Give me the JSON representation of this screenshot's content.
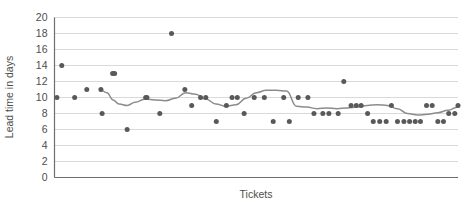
{
  "chart_data": {
    "type": "scatter",
    "title": "",
    "subtitle": "",
    "xlabel": "Tickets",
    "ylabel": "Lead time in days",
    "xlim": [
      0,
      100
    ],
    "ylim": [
      0,
      20
    ],
    "yticks": [
      0,
      2,
      4,
      6,
      8,
      10,
      12,
      14,
      16,
      18,
      20
    ],
    "ytick_labels": [
      "0",
      "2",
      "4",
      "6",
      "8",
      "10",
      "12",
      "14",
      "16",
      "18",
      "20"
    ],
    "xticks": [],
    "xtick_labels": [],
    "grid": "horizontal",
    "legend": "none",
    "annotations": [],
    "colors": {
      "marker": "#59595b",
      "trend_line": "#8c8c8e",
      "gridline": "#d9d9d9",
      "axis": "#6e6e70",
      "text": "#4d4d4d",
      "background": "#ffffff"
    },
    "series": [
      {
        "name": "Lead time per ticket",
        "type": "scatter",
        "marker": "circle",
        "x": [
          0.6,
          1.8,
          5.0,
          8.0,
          11.5,
          11.8,
          14.4,
          14.9,
          18.0,
          22.6,
          22.9,
          26.1,
          29.0,
          32.3,
          34.0,
          36.2,
          37.5,
          40.1,
          42.6,
          44.0,
          45.3,
          47.0,
          49.5,
          52.0,
          54.2,
          56.8,
          58.2,
          60.4,
          62.8,
          64.3,
          66.5,
          68.0,
          70.3,
          71.7,
          73.5,
          74.8,
          76.0,
          77.6,
          79.0,
          80.6,
          82.2,
          83.5,
          85.0,
          86.6,
          88.0,
          89.4,
          90.7,
          92.2,
          93.6,
          95.0,
          96.4,
          97.7,
          99.2,
          100.0
        ],
        "y": [
          10.0,
          14.0,
          10.0,
          11.0,
          11.0,
          8.0,
          13.0,
          13.0,
          6.0,
          10.0,
          10.0,
          8.0,
          18.0,
          11.0,
          9.0,
          10.0,
          10.0,
          7.0,
          9.0,
          10.0,
          10.0,
          8.0,
          10.0,
          10.0,
          7.0,
          10.0,
          7.0,
          10.0,
          10.0,
          8.0,
          8.0,
          8.0,
          8.0,
          12.0,
          9.0,
          9.0,
          9.0,
          8.0,
          7.0,
          7.0,
          7.0,
          9.0,
          7.0,
          7.0,
          7.0,
          7.0,
          7.0,
          9.0,
          9.0,
          7.0,
          7.0,
          8.0,
          8.0,
          9.0
        ]
      },
      {
        "name": "Rolling average",
        "type": "line",
        "x": [
          11.5,
          13.0,
          14.5,
          16.0,
          18.0,
          20.0,
          22.5,
          25.0,
          27.5,
          30.0,
          32.5,
          35.0,
          37.5,
          40.0,
          42.5,
          45.0,
          47.5,
          50.0,
          52.5,
          55.0,
          57.5,
          60.0,
          62.5,
          65.0,
          67.5,
          70.0,
          72.5,
          75.0,
          77.5,
          80.0,
          82.5,
          85.0,
          87.5,
          90.0,
          92.5,
          95.0,
          97.5,
          100.0
        ],
        "y": [
          10.9,
          10.6,
          9.7,
          9.2,
          9.0,
          9.4,
          9.8,
          9.7,
          9.6,
          9.9,
          10.6,
          10.4,
          9.8,
          9.2,
          8.9,
          9.1,
          9.9,
          10.6,
          10.9,
          10.9,
          10.8,
          8.9,
          8.8,
          8.6,
          8.7,
          8.6,
          8.7,
          8.8,
          9.0,
          9.1,
          9.0,
          8.6,
          8.0,
          7.8,
          7.9,
          8.1,
          8.4,
          8.8
        ]
      }
    ]
  }
}
